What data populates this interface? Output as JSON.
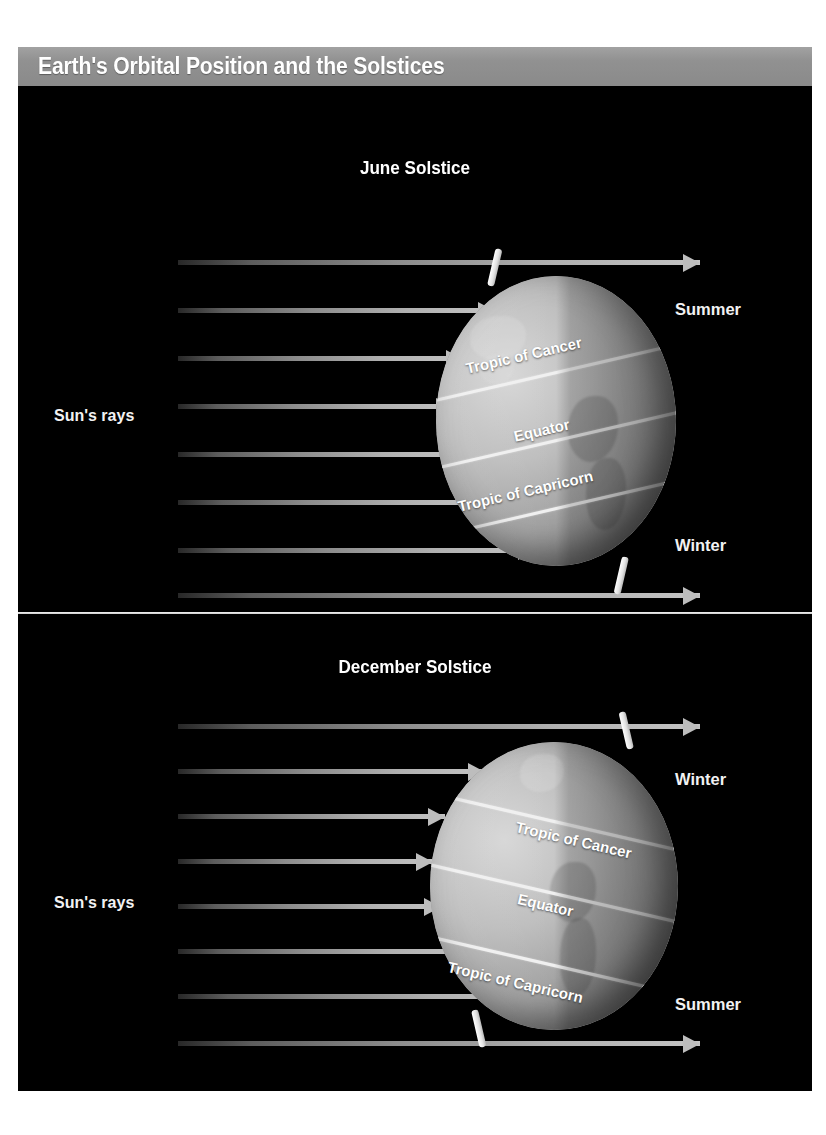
{
  "title": "Earth's Orbital Position and the Solstices",
  "panels": [
    {
      "heading": "June Solstice",
      "sun_rays_label": "Sun's rays",
      "season_top": "Summer",
      "season_bottom": "Winter",
      "latitudes": [
        "Tropic of Cancer",
        "Equator",
        "Tropic of Capricorn"
      ],
      "tilt_description": "north-pole-toward-sun"
    },
    {
      "heading": "December Solstice",
      "sun_rays_label": "Sun's rays",
      "season_top": "Winter",
      "season_bottom": "Summer",
      "latitudes": [
        "Tropic of Cancer",
        "Equator",
        "Tropic of Capricorn"
      ],
      "tilt_description": "north-pole-away-from-sun"
    }
  ],
  "colors": {
    "title_bar": "#8e8e8e",
    "panel_background": "#000000",
    "ray": "#bdbdbd",
    "label_text": "#ffffff",
    "latitude_line": "#f0f0f0"
  }
}
